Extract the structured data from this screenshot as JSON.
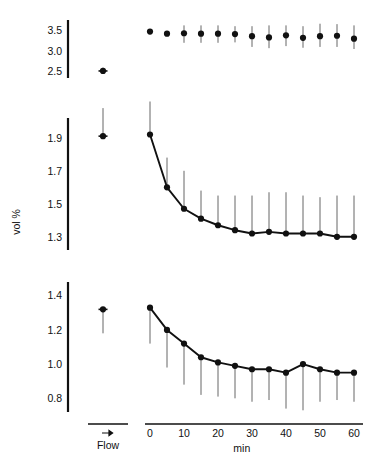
{
  "figure": {
    "ylabel": "vol %",
    "xlabel_time": "min",
    "xlabel_flow": "Flow",
    "flow_arrow_icon": "right-arrow-icon"
  },
  "chart_data": [
    {
      "type": "scatter",
      "panel": "top",
      "title": "",
      "xlabel": "min",
      "ylabel": "vol %",
      "grid": false,
      "legend": "none",
      "xlim": [
        -4,
        62
      ],
      "ylim": [
        2.35,
        3.75
      ],
      "yticks": [
        3.5,
        3.0,
        2.5
      ],
      "ytick_labels": [
        "3.5",
        "3.0",
        "2.5"
      ],
      "xticks": [
        0,
        10,
        20,
        30,
        40,
        50,
        60
      ],
      "xtick_labels": [
        "0",
        "10",
        "20",
        "30",
        "40",
        "50",
        "60"
      ],
      "flow_panel": {
        "label": "Flow",
        "value": 2.52,
        "err_low": 2.46,
        "err_high": 2.6
      },
      "x": [
        0,
        5,
        10,
        15,
        20,
        25,
        30,
        35,
        40,
        45,
        50,
        55,
        60
      ],
      "values": [
        3.47,
        3.42,
        3.43,
        3.42,
        3.42,
        3.41,
        3.36,
        3.33,
        3.38,
        3.32,
        3.36,
        3.37,
        3.3
      ],
      "err_low": [
        3.43,
        3.37,
        3.2,
        3.2,
        3.2,
        3.21,
        3.1,
        3.07,
        3.12,
        3.08,
        3.1,
        3.1,
        3.05
      ],
      "err_high": [
        3.52,
        3.47,
        3.62,
        3.62,
        3.62,
        3.6,
        3.6,
        3.62,
        3.62,
        3.6,
        3.66,
        3.65,
        3.62
      ]
    },
    {
      "type": "line",
      "panel": "middle",
      "title": "",
      "xlabel": "min",
      "ylabel": "vol %",
      "grid": false,
      "legend": "none",
      "xlim": [
        -4,
        62
      ],
      "ylim": [
        1.22,
        2.02
      ],
      "yticks": [
        1.9,
        1.7,
        1.5,
        1.3
      ],
      "ytick_labels": [
        "1.9",
        "1.7",
        "1.5",
        "1.3"
      ],
      "xticks": [
        0,
        10,
        20,
        30,
        40,
        50,
        60
      ],
      "xtick_labels": [
        "0",
        "10",
        "20",
        "30",
        "40",
        "50",
        "60"
      ],
      "flow_panel": {
        "label": "Flow",
        "value": 1.91,
        "err_low": 1.91,
        "err_high": 2.08
      },
      "x": [
        0,
        5,
        10,
        15,
        20,
        25,
        30,
        35,
        40,
        45,
        50,
        55,
        60
      ],
      "values": [
        1.92,
        1.6,
        1.47,
        1.41,
        1.37,
        1.34,
        1.32,
        1.33,
        1.32,
        1.32,
        1.32,
        1.3,
        1.3
      ],
      "err_low": [
        1.92,
        1.6,
        1.47,
        1.41,
        1.37,
        1.34,
        1.32,
        1.33,
        1.32,
        1.32,
        1.32,
        1.3,
        1.3
      ],
      "err_high": [
        2.12,
        1.78,
        1.7,
        1.58,
        1.55,
        1.55,
        1.55,
        1.57,
        1.57,
        1.55,
        1.54,
        1.55,
        1.55
      ]
    },
    {
      "type": "line",
      "panel": "bottom",
      "title": "",
      "xlabel": "min",
      "ylabel": "vol %",
      "grid": false,
      "legend": "none",
      "xlim": [
        -4,
        62
      ],
      "ylim": [
        0.72,
        1.48
      ],
      "yticks": [
        1.4,
        1.2,
        1.0,
        0.8
      ],
      "ytick_labels": [
        "1.4",
        "1.2",
        "1.0",
        "0.8"
      ],
      "xticks": [
        0,
        10,
        20,
        30,
        40,
        50,
        60
      ],
      "xtick_labels": [
        "0",
        "10",
        "20",
        "30",
        "40",
        "50",
        "60"
      ],
      "flow_panel": {
        "label": "Flow",
        "value": 1.32,
        "err_low": 1.18,
        "err_high": 1.32
      },
      "x": [
        0,
        5,
        10,
        15,
        20,
        25,
        30,
        35,
        40,
        45,
        50,
        55,
        60
      ],
      "values": [
        1.33,
        1.2,
        1.12,
        1.04,
        1.01,
        0.99,
        0.97,
        0.97,
        0.95,
        1.0,
        0.97,
        0.95,
        0.95
      ],
      "err_low": [
        1.12,
        0.98,
        0.88,
        0.82,
        0.81,
        0.8,
        0.78,
        0.79,
        0.74,
        0.73,
        0.78,
        0.79,
        0.78
      ],
      "err_high": [
        1.33,
        1.2,
        1.12,
        1.04,
        1.01,
        0.99,
        0.97,
        0.97,
        0.95,
        1.0,
        0.97,
        0.95,
        0.95
      ]
    }
  ]
}
